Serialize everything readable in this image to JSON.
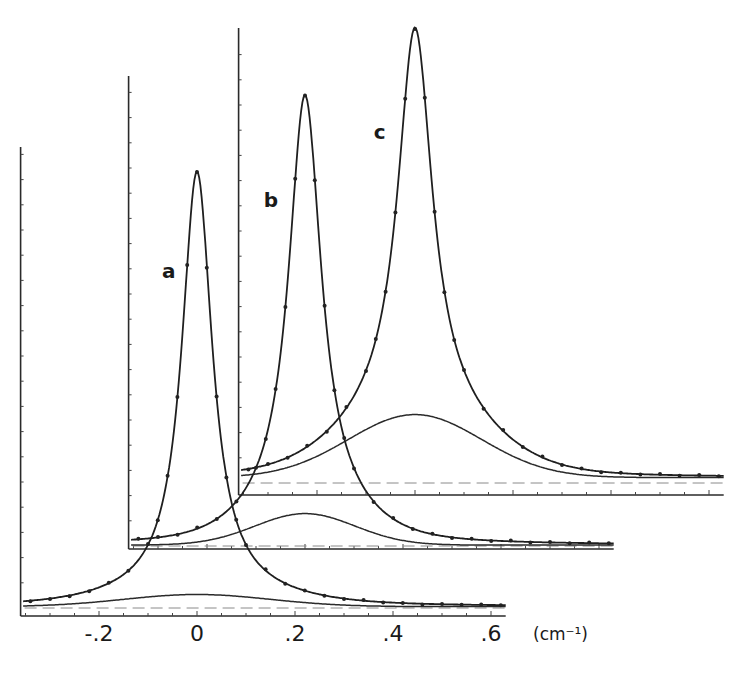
{
  "chart_data": {
    "type": "line",
    "title": "",
    "xlabel": "",
    "x_unit": "(cm⁻¹)",
    "ylabel": "",
    "xlim": [
      -0.36,
      0.63
    ],
    "ylim": [
      -2,
      103
    ],
    "grid": false,
    "legend": "none",
    "layout_style": "three offset (stacked, staggered) spectra frames; frame a front-lower-left, c back-upper-right",
    "x_ticks_labeled": [
      {
        "value": -0.2,
        "label": "-.2"
      },
      {
        "value": 0,
        "label": "0"
      },
      {
        "value": 0.2,
        "label": ".2"
      },
      {
        "value": 0.4,
        "label": ".4"
      },
      {
        "value": 0.6,
        "label": ".6"
      }
    ],
    "x_minor_tick_step": 0.05,
    "y_minor_tick_step": 5.6,
    "zero_line": "dashed",
    "series": [
      {
        "name": "a",
        "label": "a",
        "label_pos": [
          -0.055,
          75
        ],
        "fit": {
          "narrow_height": 94,
          "narrow_fwhm": 0.075,
          "broad_height": 2.7,
          "broad_fwhm": 0.35,
          "baseline": 0.3
        },
        "x": [
          -0.34,
          -0.3,
          -0.26,
          -0.22,
          -0.18,
          -0.14,
          -0.1,
          -0.08,
          -0.06,
          -0.04,
          -0.02,
          0,
          0.02,
          0.04,
          0.06,
          0.08,
          0.1,
          0.14,
          0.18,
          0.22,
          0.26,
          0.3,
          0.34,
          0.38,
          0.42,
          0.46,
          0.5,
          0.54,
          0.58,
          0.62
        ],
        "y": [
          1.5,
          2.0,
          2.6,
          3.7,
          5.6,
          8.3,
          14.2,
          19.5,
          29.4,
          46.9,
          76.2,
          96.9,
          75.6,
          47.0,
          29.0,
          19.6,
          14.0,
          8.6,
          5.4,
          3.9,
          2.7,
          2.0,
          1.8,
          1.2,
          1.1,
          0.8,
          0.9,
          0.7,
          0.8,
          0.6
        ]
      },
      {
        "name": "b",
        "label": "b",
        "label_pos": [
          -0.068,
          77
        ],
        "fit": {
          "narrow_height": 93,
          "narrow_fwhm": 0.08,
          "broad_height": 7,
          "broad_fwhm": 0.24,
          "baseline": 0.2
        },
        "x": [
          -0.34,
          -0.3,
          -0.26,
          -0.22,
          -0.18,
          -0.14,
          -0.1,
          -0.08,
          -0.06,
          -0.04,
          -0.02,
          0,
          0.02,
          0.04,
          0.06,
          0.08,
          0.1,
          0.14,
          0.18,
          0.22,
          0.26,
          0.3,
          0.34,
          0.38,
          0.42,
          0.46,
          0.5,
          0.54,
          0.58,
          0.62
        ],
        "y": [
          1.6,
          2.0,
          2.5,
          4.1,
          6.0,
          9.9,
          17.4,
          23.8,
          34.9,
          53.1,
          81.6,
          100.1,
          81.3,
          53.4,
          34.6,
          24.0,
          17.2,
          9.8,
          6.2,
          3.8,
          2.7,
          1.8,
          1.6,
          1.1,
          1.2,
          0.8,
          0.9,
          0.6,
          0.8,
          0.6
        ]
      },
      {
        "name": "c",
        "label": "c",
        "label_pos": [
          -0.068,
          78
        ],
        "fit": {
          "narrow_height": 86,
          "narrow_fwhm": 0.085,
          "broad_height": 14,
          "broad_fwhm": 0.32,
          "baseline": 1.2
        },
        "x": [
          -0.34,
          -0.3,
          -0.26,
          -0.22,
          -0.18,
          -0.14,
          -0.1,
          -0.08,
          -0.06,
          -0.04,
          -0.02,
          0,
          0.02,
          0.04,
          0.06,
          0.08,
          0.1,
          0.14,
          0.18,
          0.22,
          0.26,
          0.3,
          0.34,
          0.38,
          0.42,
          0.46,
          0.5,
          0.54,
          0.58,
          0.62
        ],
        "y": [
          3.0,
          4.2,
          5.6,
          8.3,
          11.4,
          16.9,
          24.9,
          32.0,
          42.5,
          60.1,
          85.4,
          100.9,
          85.6,
          60.3,
          42.4,
          31.8,
          25.1,
          16.5,
          11.8,
          8.0,
          5.9,
          4.0,
          3.2,
          2.4,
          2.3,
          1.9,
          2.0,
          1.6,
          1.8,
          1.5
        ]
      }
    ]
  }
}
